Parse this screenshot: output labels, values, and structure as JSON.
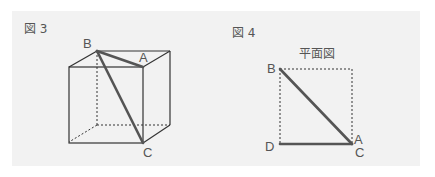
{
  "figure3": {
    "title": "図 3",
    "labels": {
      "B": "B",
      "A": "A",
      "C": "C"
    }
  },
  "figure4": {
    "title": "図 4",
    "subtitle": "平面図",
    "labels": {
      "B": "B",
      "D": "D",
      "A": "A",
      "C": "C"
    }
  },
  "colors": {
    "background": "#f2f2f2",
    "edge": "#333333",
    "highlight": "#555555",
    "label": "#555555"
  }
}
